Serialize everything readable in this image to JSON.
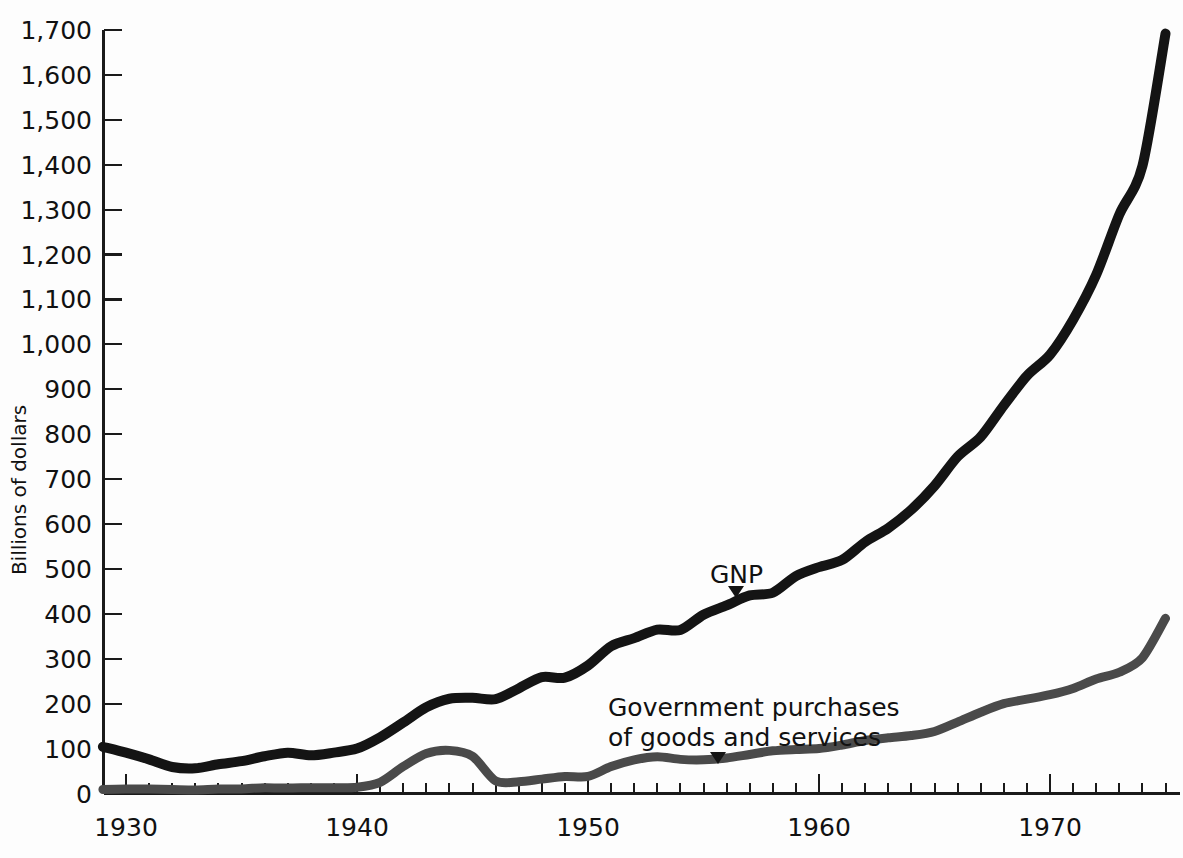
{
  "chart_data": {
    "type": "line",
    "title": "",
    "xlabel": "",
    "ylabel": "Billions of dollars",
    "xlim": [
      1929,
      1975
    ],
    "ylim": [
      0,
      1700
    ],
    "grid": false,
    "legend_position": "inline-annotations",
    "x_major_ticks": [
      1930,
      1940,
      1950,
      1960,
      1970
    ],
    "x_major_tick_labels": [
      "1930",
      "1940",
      "1950",
      "1960",
      "1970"
    ],
    "x_minor_tick_interval": 1,
    "y_ticks": [
      0,
      100,
      200,
      300,
      400,
      500,
      600,
      700,
      800,
      900,
      1000,
      1100,
      1200,
      1300,
      1400,
      1500,
      1600,
      1700
    ],
    "y_tick_labels": [
      "0",
      "100",
      "200",
      "300",
      "400",
      "500",
      "600",
      "700",
      "800",
      "900",
      "1,000",
      "1,100",
      "1,200",
      "1,300",
      "1,400",
      "1,500",
      "1,600",
      "1,700"
    ],
    "x": [
      1929,
      1930,
      1931,
      1932,
      1933,
      1934,
      1935,
      1936,
      1937,
      1938,
      1939,
      1940,
      1941,
      1942,
      1943,
      1944,
      1945,
      1946,
      1947,
      1948,
      1949,
      1950,
      1951,
      1952,
      1953,
      1954,
      1955,
      1956,
      1957,
      1958,
      1959,
      1960,
      1961,
      1962,
      1963,
      1964,
      1965,
      1966,
      1967,
      1968,
      1969,
      1970,
      1971,
      1972,
      1973,
      1974,
      1975
    ],
    "series": [
      {
        "name": "GNP",
        "color": "#141414",
        "annotation": "GNP",
        "values": [
          104,
          91,
          76,
          59,
          56,
          65,
          72,
          83,
          91,
          85,
          91,
          100,
          125,
          158,
          192,
          211,
          213,
          210,
          234,
          259,
          258,
          285,
          328,
          346,
          365,
          364,
          398,
          419,
          441,
          447,
          484,
          504,
          520,
          560,
          591,
          632,
          685,
          750,
          794,
          864,
          930,
          977,
          1055,
          1155,
          1289,
          1397,
          1692
        ]
      },
      {
        "name": "Government purchases of goods and services",
        "color": "#4a4a4a",
        "annotation": "Government purchases\nof goods and services",
        "annotation_line1": "Government purchases",
        "annotation_line2": "of goods and services",
        "values": [
          9,
          10,
          10,
          9,
          8,
          10,
          10,
          13,
          12,
          13,
          13,
          14,
          25,
          60,
          89,
          96,
          83,
          28,
          26,
          32,
          38,
          38,
          60,
          75,
          82,
          76,
          75,
          79,
          87,
          95,
          98,
          100,
          108,
          118,
          124,
          129,
          138,
          159,
          181,
          200,
          210,
          220,
          234,
          255,
          270,
          302,
          390
        ]
      }
    ],
    "annotations": [
      {
        "text": "GNP",
        "at_year": 1957,
        "at_value": 441
      },
      {
        "text": "Government purchases of goods and services",
        "at_year": 1956,
        "at_value": 79
      }
    ]
  },
  "axes": {
    "y_axis_title": "Billions of dollars"
  }
}
